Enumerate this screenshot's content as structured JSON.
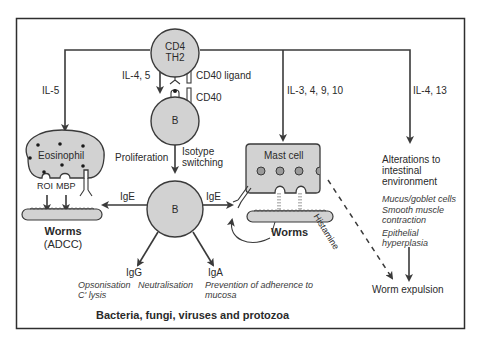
{
  "diagram": {
    "title": "Bacteria, fungi, viruses and protozoa",
    "colors": {
      "cell_fill": "#d2d2d2",
      "stroke": "#3a3a3a",
      "border": "#2e2e2e",
      "background": "#ffffff"
    },
    "nodes": {
      "th2": {
        "line1": "CD4",
        "line2": "TH2"
      },
      "b_top": {
        "label": "B"
      },
      "b_center": {
        "label": "B"
      },
      "eosinophil": {
        "label": "Eosinophil"
      },
      "mast_cell": {
        "label": "Mast cell"
      },
      "worms_left": {
        "label": "Worms",
        "sub": "(ADCC)"
      },
      "worms_right": {
        "label": "Worms"
      }
    },
    "labels": {
      "il5": "IL-5",
      "il45": "IL-4, 5",
      "cd40_ligand": "CD40 ligand",
      "cd40": "CD40",
      "il3_4_9_10": "IL-3, 4, 9, 10",
      "il4_13": "IL-4, 13",
      "proliferation": "Proliferation",
      "isotype_line1": "Isotype",
      "isotype_line2": "switching",
      "roi": "ROI",
      "mbp": "MBP",
      "ige_left": "IgE",
      "ige_right": "IgE",
      "histamine": "Histamine",
      "igg": "IgG",
      "iga": "IgA",
      "opsonisation": "Opsonisation",
      "c_lysis": "C' lysis",
      "neutralisation": "Neutralisation",
      "prevention_line1": "Prevention of adherence to",
      "prevention_line2": "mucosa",
      "alterations_line1": "Alterations to",
      "alterations_line2": "intestinal",
      "alterations_line3": "environment",
      "mucus": "Mucus/goblet cells",
      "smooth_line1": "Smooth muscle",
      "smooth_line2": "contraction",
      "epithelial_line1": "Epithelial",
      "epithelial_line2": "hyperplasia",
      "worm_expulsion": "Worm expulsion"
    }
  }
}
